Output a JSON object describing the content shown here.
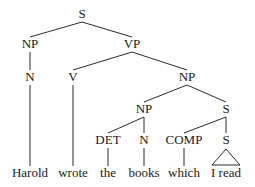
{
  "diagram": {
    "type": "syntax-tree",
    "nodes": [
      {
        "id": "s",
        "label": "S",
        "parent": null
      },
      {
        "id": "np1",
        "label": "NP",
        "parent": "s"
      },
      {
        "id": "vp",
        "label": "VP",
        "parent": "s"
      },
      {
        "id": "n1",
        "label": "N",
        "parent": "np1"
      },
      {
        "id": "v",
        "label": "V",
        "parent": "vp"
      },
      {
        "id": "np2",
        "label": "NP",
        "parent": "vp"
      },
      {
        "id": "np3",
        "label": "NP",
        "parent": "np2"
      },
      {
        "id": "s2",
        "label": "S",
        "parent": "np2"
      },
      {
        "id": "det",
        "label": "DET",
        "parent": "np3"
      },
      {
        "id": "n2",
        "label": "N",
        "parent": "np3"
      },
      {
        "id": "comp",
        "label": "COMP",
        "parent": "s2"
      },
      {
        "id": "s3",
        "label": "S",
        "parent": "s2"
      }
    ],
    "leaves": [
      {
        "id": "w1",
        "label": "Harold",
        "parent": "n1"
      },
      {
        "id": "w2",
        "label": "wrote",
        "parent": "v"
      },
      {
        "id": "w3",
        "label": "the",
        "parent": "det"
      },
      {
        "id": "w4",
        "label": "books",
        "parent": "n2"
      },
      {
        "id": "w5",
        "label": "which",
        "parent": "comp"
      },
      {
        "id": "w6",
        "label": "I read",
        "parent": "s3",
        "triangle": true
      }
    ]
  }
}
